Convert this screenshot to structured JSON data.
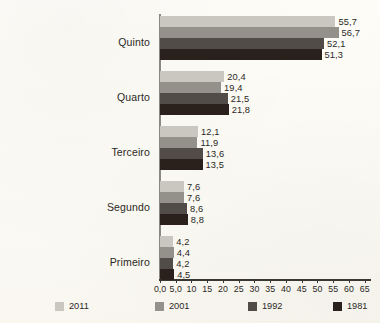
{
  "chart_data": {
    "type": "bar",
    "orientation": "horizontal",
    "title": "",
    "subtitle": "",
    "xlabel": "",
    "ylabel": "",
    "xlim": [
      0,
      67
    ],
    "grid": false,
    "legend_position": "bottom",
    "categories": [
      "Quinto",
      "Quarto",
      "Terceiro",
      "Segundo",
      "Primeiro"
    ],
    "tick_labels": [
      "0,0",
      "5,0",
      "10",
      "15",
      "20",
      "25",
      "30",
      "35",
      "40",
      "45",
      "50",
      "55",
      "60",
      "65"
    ],
    "tick_values": [
      0,
      5,
      10,
      15,
      20,
      25,
      30,
      35,
      40,
      45,
      50,
      55,
      60,
      65
    ],
    "series": [
      {
        "name": "2011",
        "color": "#c9c7bf",
        "values": [
          55.7,
          20.4,
          12.1,
          7.6,
          4.2
        ],
        "labels": [
          "55,7",
          "20,4",
          "12,1",
          "7,6",
          "4,2"
        ]
      },
      {
        "name": "2001",
        "color": "#93918a",
        "values": [
          56.7,
          19.4,
          11.9,
          7.6,
          4.4
        ],
        "labels": [
          "56,7",
          "19,4",
          "11,9",
          "7,6",
          "4,4"
        ]
      },
      {
        "name": "1992",
        "color": "#514c47",
        "values": [
          52.1,
          21.5,
          13.6,
          8.6,
          4.2
        ],
        "labels": [
          "52,1",
          "21,5",
          "13,6",
          "8,6",
          "4,2"
        ]
      },
      {
        "name": "1981",
        "color": "#2a211d",
        "values": [
          51.3,
          21.8,
          13.5,
          8.8,
          4.5
        ],
        "labels": [
          "51,3",
          "21,8",
          "13,5",
          "8,8",
          "4,5"
        ]
      }
    ]
  },
  "legend": {
    "entries": [
      {
        "label": "2011",
        "color": "#c9c7bf"
      },
      {
        "label": "2001",
        "color": "#93918a"
      },
      {
        "label": "1992",
        "color": "#514c47"
      },
      {
        "label": "1981",
        "color": "#2a211d"
      }
    ]
  }
}
